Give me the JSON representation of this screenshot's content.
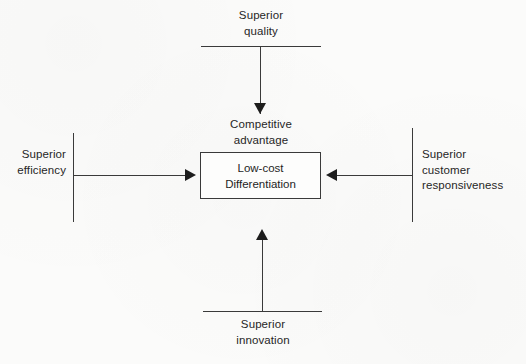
{
  "diagram": {
    "center": {
      "caption": "Competitive\nadvantage",
      "box_lines": [
        "Low-cost",
        "Differentiation"
      ]
    },
    "inputs": {
      "top": {
        "label": "Superior\nquality",
        "arrow": "down-arrow"
      },
      "left": {
        "label": "Superior\nefficiency",
        "arrow": "right-arrow"
      },
      "right": {
        "label": "Superior\ncustomer\nresponsiveness",
        "arrow": "left-arrow"
      },
      "bottom": {
        "label": "Superior\ninnovation",
        "arrow": "up-arrow"
      }
    },
    "colors": {
      "background": "#fbfbfa",
      "line": "#3a3a3a",
      "arrow": "#1d1d1d",
      "text": "#262626"
    }
  }
}
